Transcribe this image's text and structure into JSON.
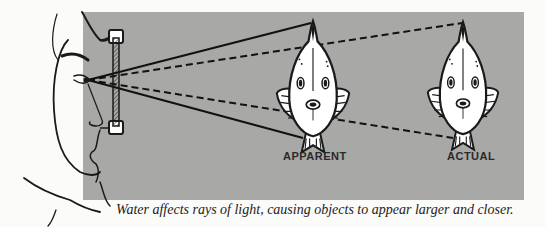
{
  "diagram": {
    "labels": {
      "apparent": "APPARENT",
      "actual": "ACTUAL"
    },
    "caption": "Water affects rays of light, causing objects to appear larger and closer.",
    "colors": {
      "panel": "#a8a8a6",
      "ink": "#1a1a1a",
      "background": "#fbfbf9"
    },
    "elements": [
      "face-profile",
      "dive-mask-lens",
      "solid-sight-lines",
      "dashed-refracted-lines",
      "apparent-fish",
      "actual-fish"
    ]
  }
}
